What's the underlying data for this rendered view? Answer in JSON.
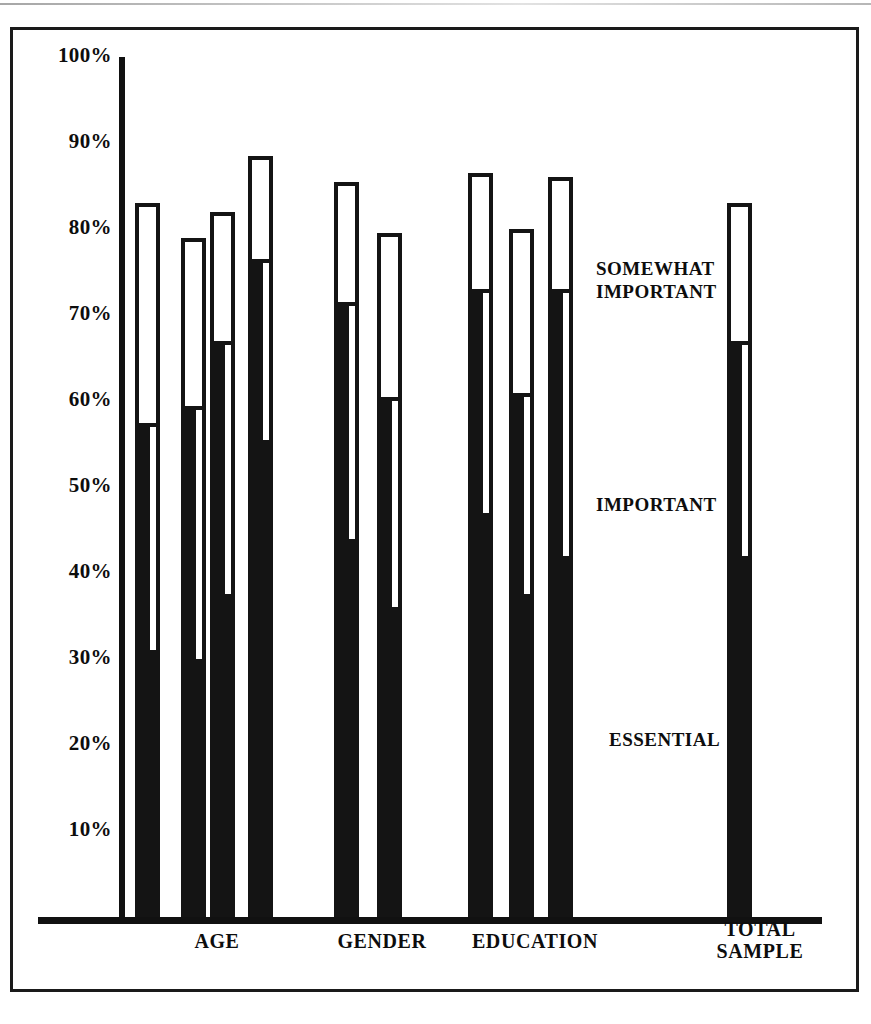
{
  "chart_data": {
    "type": "bar",
    "title": "",
    "subtitle": "",
    "xlabel": "",
    "ylabel": "",
    "orientation": "vertical",
    "stacked": true,
    "grid": false,
    "ylim": [
      0,
      100
    ],
    "ytick_labels": [
      "100%",
      "90%",
      "80%",
      "70%",
      "60%",
      "50%",
      "40%",
      "30%",
      "20%",
      "10%"
    ],
    "ytick_values": [
      100,
      90,
      80,
      70,
      60,
      50,
      40,
      30,
      20,
      10
    ],
    "legend_position": "inside-right",
    "legend_entries": [
      "SOMEWHAT IMPORTANT",
      "IMPORTANT",
      "ESSENTIAL"
    ],
    "group_labels": [
      "AGE",
      "GENDER",
      "EDUCATION",
      "TOTAL SAMPLE"
    ],
    "series": [
      {
        "name": "ESSENTIAL",
        "values": [
          31,
          30,
          37.5,
          55.5,
          44,
          36,
          47,
          37.5,
          42
        ]
      },
      {
        "name": "IMPORTANT",
        "values": [
          26,
          29,
          29.5,
          20.5,
          27,
          24,
          25,
          23,
          24.5
        ]
      },
      {
        "name": "SOMEWHAT IMPORTANT",
        "values": [
          26,
          20,
          15,
          12.5,
          14.5,
          19.5,
          14.5,
          19.5,
          16.5
        ]
      }
    ],
    "bars": [
      {
        "group": "AGE",
        "total": 83.0,
        "essential_plus_important": 57.0,
        "essential": 31.0
      },
      {
        "group": "AGE",
        "total": 79.0,
        "essential_plus_important": 59.0,
        "essential": 30.0
      },
      {
        "group": "AGE",
        "total": 82.0,
        "essential_plus_important": 66.5,
        "essential": 37.5
      },
      {
        "group": "AGE",
        "total": 88.5,
        "essential_plus_important": 76.0,
        "essential": 55.5
      },
      {
        "group": "GENDER",
        "total": 85.5,
        "essential_plus_important": 71.0,
        "essential": 44.0
      },
      {
        "group": "GENDER",
        "total": 79.5,
        "essential_plus_important": 60.0,
        "essential": 36.0
      },
      {
        "group": "EDUCATION",
        "total": 86.5,
        "essential_plus_important": 72.5,
        "essential": 47.0
      },
      {
        "group": "EDUCATION",
        "total": 80.0,
        "essential_plus_important": 60.5,
        "essential": 37.5
      },
      {
        "group": "EDUCATION",
        "total": 86.0,
        "essential_plus_important": 72.5,
        "essential": 42.0
      },
      {
        "group": "TOTAL SAMPLE",
        "total": 83.0,
        "essential_plus_important": 66.5,
        "essential": 42.0
      }
    ]
  },
  "axis": {
    "yticks": [
      {
        "label": "100%"
      },
      {
        "label": "90%"
      },
      {
        "label": "80%"
      },
      {
        "label": "70%"
      },
      {
        "label": "60%"
      },
      {
        "label": "50%"
      },
      {
        "label": "40%"
      },
      {
        "label": "30%"
      },
      {
        "label": "20%"
      },
      {
        "label": "10%"
      }
    ]
  },
  "legend": {
    "somewhat_important": "SOMEWHAT\nIMPORTANT",
    "important": "IMPORTANT",
    "essential": "ESSENTIAL"
  },
  "groups": [
    {
      "label": "AGE"
    },
    {
      "label": "GENDER"
    },
    {
      "label": "EDUCATION"
    },
    {
      "label": "TOTAL\nSAMPLE"
    }
  ],
  "colors": {
    "ink": "#141414",
    "paper": "#ffffff"
  }
}
